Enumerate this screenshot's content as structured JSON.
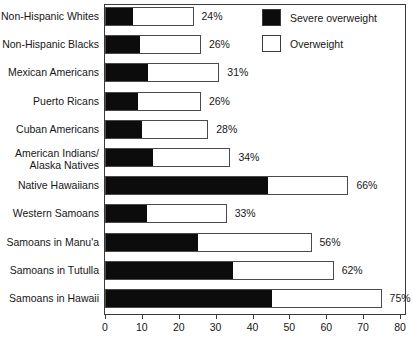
{
  "chart_data": {
    "type": "bar",
    "orientation": "horizontal",
    "stacked": true,
    "title": "",
    "subtitle": "",
    "xlabel": "",
    "ylabel": "",
    "xlim": [
      0,
      80
    ],
    "xticks": [
      0,
      10,
      20,
      30,
      40,
      50,
      60,
      70,
      80
    ],
    "grid": false,
    "legend_position": "top-right",
    "categories": [
      "Non-Hispanic Whites",
      "Non-Hispanic Blacks",
      "Mexican Americans",
      "Puerto Ricans",
      "Cuban Americans",
      "American Indians/\nAlaska Natives",
      "Native Hawaiians",
      "Western Samoans",
      "Samoans in Manu'a",
      "Samoans in Tutulla",
      "Samoans in Hawaii"
    ],
    "series": [
      {
        "name": "Severe overweight",
        "color": "#0c0c0c",
        "values": [
          7.3,
          9.2,
          11.4,
          8.7,
          9.8,
          12.7,
          44.0,
          11.0,
          25.0,
          34.5,
          45.0
        ]
      },
      {
        "name": "Overweight",
        "color": "#ffffff",
        "values": [
          16.7,
          16.8,
          19.6,
          17.3,
          18.2,
          21.3,
          22.0,
          22.0,
          31.0,
          27.5,
          30.0
        ]
      }
    ],
    "totals": [
      24,
      26,
      31,
      26,
      28,
      34,
      66,
      33,
      56,
      62,
      75
    ],
    "data_labels": [
      "24%",
      "26%",
      "31%",
      "26%",
      "28%",
      "34%",
      "66%",
      "33%",
      "56%",
      "62%",
      "75%"
    ]
  },
  "legend": {
    "items": [
      {
        "label": "Severe overweight",
        "swatch": "black-filled-square"
      },
      {
        "label": "Overweight",
        "swatch": "white-outlined-square"
      }
    ]
  },
  "axis": {
    "tick_labels": [
      "0",
      "10",
      "20",
      "30",
      "40",
      "50",
      "60",
      "70",
      "80"
    ]
  }
}
